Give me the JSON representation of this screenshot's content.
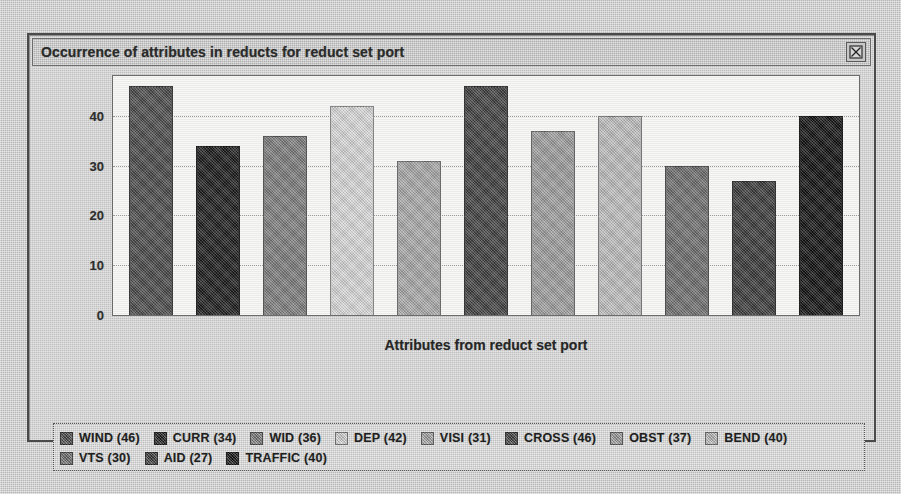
{
  "window": {
    "title": "Occurrence of attributes in reducts for reduct set port",
    "close_label": "☒",
    "close_icon": "close-box-icon"
  },
  "chart_data": {
    "type": "bar",
    "title": "Occurrence of attributes in reducts for reduct set port",
    "xlabel": "Attributes from reduct set port",
    "ylabel": "",
    "ylim": [
      0,
      48
    ],
    "yticks": [
      0,
      10,
      20,
      30,
      40
    ],
    "grid": true,
    "legend_position": "bottom",
    "categories": [
      "WIND",
      "CURR",
      "WID",
      "DEP",
      "VISI",
      "CROSS",
      "OBST",
      "BEND",
      "VTS",
      "AID",
      "TRAFFIC"
    ],
    "values": [
      46,
      34,
      36,
      42,
      31,
      46,
      37,
      40,
      30,
      27,
      40
    ],
    "colors": [
      "#4a4a4a",
      "#1c1c1c",
      "#7d7d7d",
      "#d8d8d8",
      "#a8a8a8",
      "#3f3f3f",
      "#9d9d9d",
      "#bdbdbd",
      "#6e6e6e",
      "#3a3a3a",
      "#111111"
    ],
    "bars": [
      {
        "label": "WIND",
        "value": 46,
        "color": "#4a4a4a"
      },
      {
        "label": "CURR",
        "value": 34,
        "color": "#1c1c1c"
      },
      {
        "label": "WID",
        "value": 36,
        "color": "#7d7d7d"
      },
      {
        "label": "DEP",
        "value": 42,
        "color": "#d8d8d8"
      },
      {
        "label": "VISI",
        "value": 31,
        "color": "#a8a8a8"
      },
      {
        "label": "CROSS",
        "value": 46,
        "color": "#3f3f3f"
      },
      {
        "label": "OBST",
        "value": 37,
        "color": "#9d9d9d"
      },
      {
        "label": "BEND",
        "value": 40,
        "color": "#bdbdbd"
      },
      {
        "label": "VTS",
        "value": 30,
        "color": "#6e6e6e"
      },
      {
        "label": "AID",
        "value": 27,
        "color": "#3a3a3a"
      },
      {
        "label": "TRAFFIC",
        "value": 40,
        "color": "#111111"
      }
    ]
  },
  "axis": {
    "yticks": [
      "40",
      "30",
      "20",
      "10",
      "0"
    ],
    "xlabel": "Attributes from reduct set port"
  },
  "legend": {
    "rows": [
      [
        {
          "label": "WIND (46)",
          "color": "#4a4a4a"
        },
        {
          "label": "CURR (34)",
          "color": "#1c1c1c"
        },
        {
          "label": "WID (36)",
          "color": "#7d7d7d"
        },
        {
          "label": "DEP (42)",
          "color": "#d8d8d8"
        },
        {
          "label": "VISI (31)",
          "color": "#a8a8a8"
        },
        {
          "label": "CROSS (46)",
          "color": "#3f3f3f"
        },
        {
          "label": "OBST (37)",
          "color": "#9d9d9d"
        },
        {
          "label": "BEND (40)",
          "color": "#bdbdbd"
        }
      ],
      [
        {
          "label": "VTS (30)",
          "color": "#6e6e6e"
        },
        {
          "label": "AID (27)",
          "color": "#3a3a3a"
        },
        {
          "label": "TRAFFIC (40)",
          "color": "#111111"
        }
      ]
    ]
  }
}
